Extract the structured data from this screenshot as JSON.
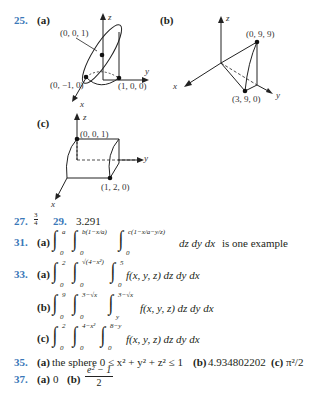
{
  "problem25": {
    "number": "25.",
    "a": {
      "label": "(a)",
      "axis_z": "z",
      "axis_y": "y",
      "axis_x": "x",
      "points": [
        "(0, 0, 1)",
        "(0, −1, 0)",
        "(1, 0, 0)"
      ]
    },
    "b": {
      "label": "(b)",
      "axis_z": "z",
      "axis_y": "y",
      "axis_x": "x",
      "points": [
        "(0, 9, 9)",
        "(3, 9, 0)"
      ]
    },
    "c": {
      "label": "(c)",
      "axis_z": "z",
      "axis_y": "y",
      "axis_x": "x",
      "points": [
        "(0, 0, 1)",
        "(1, 2, 0)"
      ]
    }
  },
  "problem27": {
    "number": "27.",
    "answer_num": "3",
    "answer_den": "4"
  },
  "problem29": {
    "number": "29.",
    "answer": "3.291"
  },
  "problem31": {
    "number": "31.",
    "part": "(a)",
    "limits": [
      {
        "lower": "0",
        "upper": "a"
      },
      {
        "lower": "0",
        "upper": "b(1−x/a)"
      },
      {
        "lower": "0",
        "upper": "c(1−x/a−y/z)"
      }
    ],
    "tail": "dz dy dx",
    "suffix": "is one example"
  },
  "problem33": {
    "number": "33.",
    "a": {
      "label": "(a)",
      "limits": [
        {
          "lower": "0",
          "upper": "2"
        },
        {
          "lower": "0",
          "upper": "√(4−x²)"
        },
        {
          "lower": "0",
          "upper": "5"
        }
      ],
      "integrand": "f(x, y, z) dz dy dx"
    },
    "b": {
      "label": "(b)",
      "limits": [
        {
          "lower": "0",
          "upper": "9"
        },
        {
          "lower": "0",
          "upper": "3−√x"
        },
        {
          "lower": "y",
          "upper": "3−√x"
        }
      ],
      "integrand": "f(x, y, z) dz dy dx"
    },
    "c": {
      "label": "(c)",
      "limits": [
        {
          "lower": "0",
          "upper": "2"
        },
        {
          "lower": "0",
          "upper": "4−x²"
        },
        {
          "lower": "0",
          "upper": "8−y"
        }
      ],
      "integrand": "f(x, y, z) dz dy dx"
    }
  },
  "problem35": {
    "number": "35.",
    "a_label": "(a)",
    "a_text": "the sphere 0 ≤ x² + y² + z² ≤ 1",
    "b_label": "(b)",
    "b_text": "4.934802202",
    "c_label": "(c)",
    "c_text": "π²/2"
  },
  "problem37": {
    "number": "37.",
    "a_label": "(a)",
    "a_text": "0",
    "b_label": "(b)",
    "b_num": "e² − 1",
    "b_den": "2"
  }
}
